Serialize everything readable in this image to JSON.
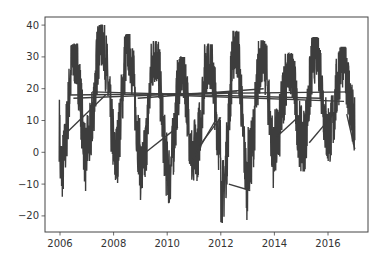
{
  "chart_data": {
    "type": "line",
    "title": "",
    "xlabel": "",
    "ylabel": "",
    "xlim": [
      2005.5,
      2017.3
    ],
    "ylim": [
      -25,
      43
    ],
    "grid": false,
    "legend": null,
    "x_ticks": [
      2006,
      2008,
      2010,
      2012,
      2014,
      2016
    ],
    "x_tick_labels": [
      "2006",
      "2008",
      "2010",
      "2012",
      "2014",
      "2016"
    ],
    "y_ticks": [
      -20,
      -10,
      0,
      10,
      20,
      30,
      40
    ],
    "y_tick_labels": [
      "−20",
      "−10",
      "0",
      "10",
      "20",
      "30",
      "40"
    ],
    "line_color": "#3d3d3d",
    "series": [
      {
        "name": "temperature",
        "description": "Dense daily seasonal series; yearly summer peaks and winter troughs",
        "seasonal_extremes": [
          {
            "year": 2006,
            "summer_peak": 34,
            "winter_trough": -14
          },
          {
            "year": 2007,
            "summer_peak": 40,
            "winter_trough": -6
          },
          {
            "year": 2008,
            "summer_peak": 37,
            "winter_trough": -11
          },
          {
            "year": 2009,
            "summer_peak": 35,
            "winter_trough": -15
          },
          {
            "year": 2010,
            "summer_peak": 30,
            "winter_trough": -16
          },
          {
            "year": 2011,
            "summer_peak": 34,
            "winter_trough": -9
          },
          {
            "year": 2012,
            "summer_peak": 38,
            "winter_trough": -22
          },
          {
            "year": 2013,
            "summer_peak": 35,
            "winter_trough": -12
          },
          {
            "year": 2014,
            "summer_peak": 31,
            "winter_trough": -6
          },
          {
            "year": 2015,
            "summer_peak": 36,
            "winter_trough": -6
          },
          {
            "year": 2016,
            "summer_peak": 33,
            "winter_trough": -3
          }
        ],
        "x_end": 2017.0,
        "end_value": 0
      }
    ],
    "connector_lines_note": "Straight segments connecting out-of-order dates, mostly spanning y≈15–20 across 2006–2017"
  }
}
